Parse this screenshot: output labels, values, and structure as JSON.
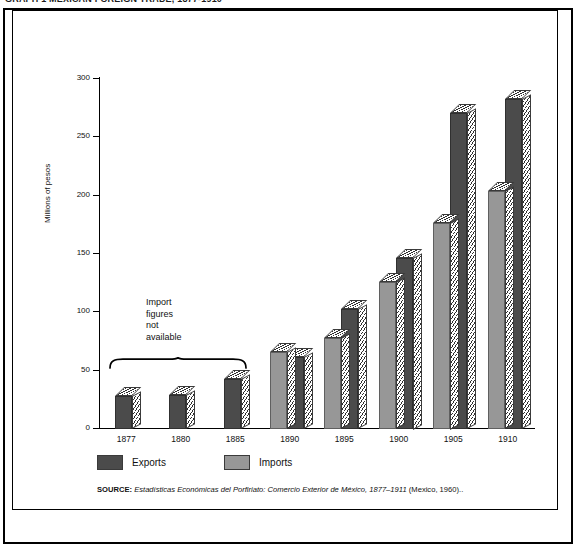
{
  "figure": {
    "cropped_title": "GRAPH 1  MEXICAN FOREIGN TRADE, 1877-1910",
    "axis_label_y": "Millions of pesos",
    "annotation": [
      "Import",
      "figures",
      "not",
      "available"
    ],
    "source_label": "SOURCE:",
    "source_italic": "Estadísticas Económicas del Porfiriato: Comercio Exterior de México, 1877–1911",
    "source_tail": "(Mexico, 1960)."
  },
  "legend": {
    "items": [
      {
        "label": "Exports",
        "color": "#4b4b4b",
        "swatch": "exports"
      },
      {
        "label": "Imports",
        "color": "#979797",
        "swatch": "imports"
      }
    ]
  },
  "chart_data": {
    "type": "bar",
    "title": "Mexican Foreign Trade, 1877-1910",
    "xlabel": "",
    "ylabel": "Millions of pesos",
    "ylim": [
      0,
      300
    ],
    "yticks": [
      0,
      50,
      100,
      150,
      200,
      250,
      300
    ],
    "ytick_labels": [
      "0",
      "50",
      "100",
      "150",
      "200",
      "250",
      "300"
    ],
    "grid": false,
    "legend_position": "below-axis-left",
    "categories": [
      "1877",
      "1880",
      "1885",
      "1890",
      "1895",
      "1900",
      "1905",
      "1910"
    ],
    "series": [
      {
        "name": "Imports",
        "color": "#979797",
        "values": [
          null,
          null,
          null,
          66,
          78,
          126,
          177,
          204
        ]
      },
      {
        "name": "Exports",
        "color": "#4b4b4b",
        "values": [
          28,
          29,
          43,
          62,
          103,
          147,
          271,
          283
        ]
      }
    ],
    "notes": [
      {
        "text": "Import figures not available",
        "covers": [
          "1877",
          "1880",
          "1885"
        ]
      }
    ]
  }
}
